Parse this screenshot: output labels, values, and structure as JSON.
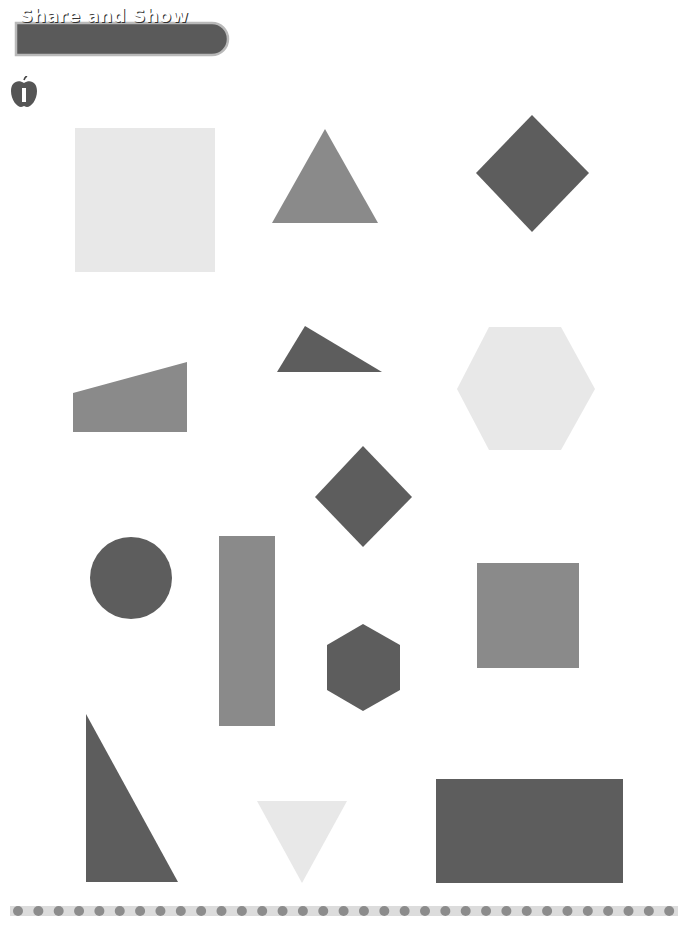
{
  "section": {
    "title": "Share and Show",
    "exercise_number": "1"
  },
  "colors": {
    "banner_fill": "#5a5a5a",
    "banner_outline": "#b9b9b9",
    "dark": "#5d5d5d",
    "medium": "#8a8a8a",
    "light": "#e8e8e8",
    "dot": "#8c8c8c",
    "dot_band": "#dcdcdc"
  },
  "shapes": [
    {
      "name": "large-light-square",
      "type": "square",
      "shade": "light"
    },
    {
      "name": "medium-triangle",
      "type": "triangle",
      "shade": "medium"
    },
    {
      "name": "dark-diamond-top",
      "type": "rhombus",
      "shade": "dark"
    },
    {
      "name": "medium-trapezoid",
      "type": "trapezoid",
      "shade": "medium"
    },
    {
      "name": "dark-small-triangle",
      "type": "triangle",
      "shade": "dark"
    },
    {
      "name": "light-hexagon",
      "type": "hexagon",
      "shade": "light"
    },
    {
      "name": "dark-diamond-middle",
      "type": "rhombus",
      "shade": "dark"
    },
    {
      "name": "dark-circle",
      "type": "circle",
      "shade": "dark"
    },
    {
      "name": "medium-tall-rectangle",
      "type": "rectangle",
      "shade": "medium"
    },
    {
      "name": "dark-small-hexagon",
      "type": "hexagon",
      "shade": "dark"
    },
    {
      "name": "medium-square",
      "type": "square",
      "shade": "medium"
    },
    {
      "name": "dark-right-triangle",
      "type": "triangle",
      "shade": "dark"
    },
    {
      "name": "light-inverted-triangle",
      "type": "triangle",
      "shade": "light"
    },
    {
      "name": "dark-wide-rectangle",
      "type": "rectangle",
      "shade": "dark"
    }
  ],
  "divider": {
    "dot_count": 33
  }
}
